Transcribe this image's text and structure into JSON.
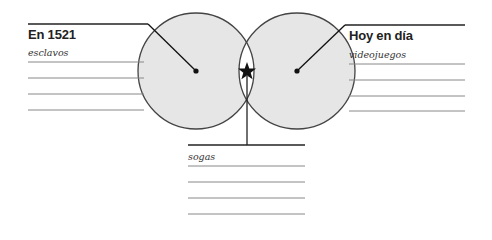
{
  "diagram": {
    "type": "venn",
    "left": {
      "heading": "En 1521",
      "entries": [
        "esclavos",
        "",
        "",
        ""
      ]
    },
    "right": {
      "heading": "Hoy en día",
      "entries": [
        "videojuegos",
        "",
        "",
        ""
      ]
    },
    "center": {
      "marker": "★",
      "entries": [
        "sogas",
        "",
        "",
        ""
      ]
    },
    "colors": {
      "circle_fill": "#e6e6e6",
      "overlap_fill": "#ffffff",
      "stroke": "#333333",
      "rule_line": "#888888"
    }
  }
}
